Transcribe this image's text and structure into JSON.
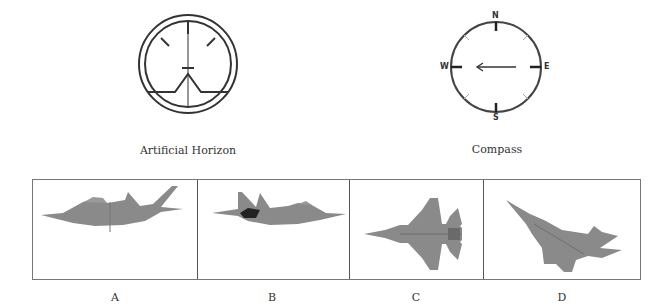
{
  "instruments": {
    "horizon": {
      "label": "Artificial Horizon"
    },
    "compass": {
      "label": "Compass",
      "directions": {
        "n": "N",
        "e": "E",
        "s": "S",
        "w": "W"
      },
      "arrow_heading": "W"
    }
  },
  "options": [
    {
      "label": "A",
      "view": "side view, nose left, level"
    },
    {
      "label": "B",
      "view": "side view, nose right, level"
    },
    {
      "label": "C",
      "view": "top view, nose left"
    },
    {
      "label": "D",
      "view": "diving view, nose up-left"
    }
  ],
  "colors": {
    "aircraft": "#8a8a8a",
    "line": "#333333",
    "border": "#777777"
  }
}
